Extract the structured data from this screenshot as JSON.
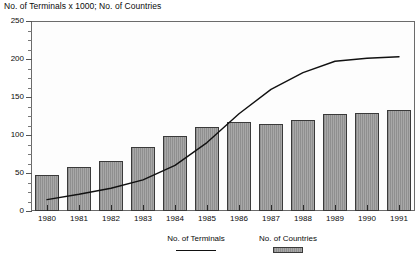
{
  "chart_data": {
    "type": "bar",
    "title": "No. of Terminals x 1000; No. of Countries",
    "xlabel": "",
    "ylabel": "",
    "ylim": [
      0,
      250
    ],
    "yticks": [
      0,
      50,
      100,
      150,
      200,
      250
    ],
    "ytick_labels": [
      "0",
      "50",
      "100",
      "150",
      "200",
      "250"
    ],
    "minor_ytick_step": 12.5,
    "grid": false,
    "legend_position": "bottom",
    "categories": [
      "1980",
      "1981",
      "1982",
      "1983",
      "1984",
      "1985",
      "1986",
      "1987",
      "1988",
      "1989",
      "1990",
      "1991"
    ],
    "series": [
      {
        "name": "No. of Countries",
        "render": "bar",
        "values": [
          48,
          58,
          66,
          84,
          99,
          110,
          117,
          115,
          120,
          128,
          129,
          133
        ]
      },
      {
        "name": "No. of Terminals",
        "render": "line",
        "values": [
          15,
          22,
          30,
          41,
          60,
          90,
          128,
          160,
          182,
          197,
          201,
          203
        ]
      }
    ],
    "colors": {
      "bar_fill": "#9c9c9c",
      "bar_edge": "#3a3a3a",
      "line": "#111111",
      "axis": "#6b6b6b",
      "text": "#0b0b0b",
      "plot_background": "#fdfdfd",
      "page_background": "#ffffff"
    }
  },
  "legend": {
    "entries": [
      {
        "label": "No. of Terminals",
        "swatch": "line"
      },
      {
        "label": "No. of Countries",
        "swatch": "bar"
      }
    ]
  }
}
